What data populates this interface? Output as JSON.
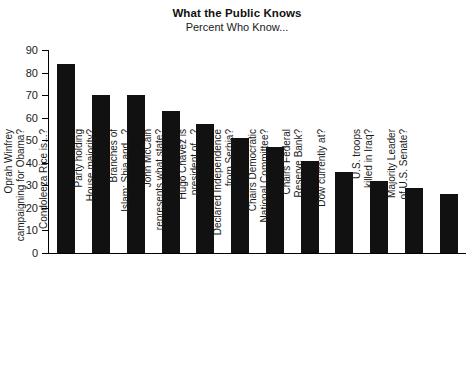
{
  "chart_data": {
    "type": "bar",
    "title": "What the Public Knows",
    "subtitle": "Percent Who Know...",
    "xlabel": "",
    "ylabel": "",
    "ylim": [
      0,
      90
    ],
    "ytick_step": 10,
    "yticks": [
      90,
      80,
      70,
      60,
      50,
      40,
      30,
      20,
      10,
      0
    ],
    "grid": false,
    "legend": "none",
    "bar_color": "#111111",
    "categories": [
      "Oprah Winfrey campaigning for Obama?",
      "Condoleeza Rice is...?",
      "Party holding House majority?",
      "Branches of Islam: Shia and...?",
      "John McCain represents what state?",
      "Hugo Chavez is president of...?",
      "Declared Independence from Serbia?",
      "Chairs Democratic National Committee?",
      "Chairs Federal Reserve Bank?",
      "Dow currently at?",
      "U.S. troops killed in Iraq?",
      "Majority Leader of U.S. Senate?"
    ],
    "category_lines": [
      [
        "Oprah Winfrey",
        "campaigning for Obama?"
      ],
      [
        "Condoleeza Rice is...?",
        ""
      ],
      [
        "Party holding",
        "House majority?"
      ],
      [
        "Branches of",
        "Islam: Shia and...?"
      ],
      [
        "John McCain",
        "represents what state?"
      ],
      [
        "Hugo Chavez is",
        "president of...?"
      ],
      [
        "Declared Independence",
        "from Serbia?"
      ],
      [
        "Chairs Democratic",
        "National Committee?"
      ],
      [
        "Chairs Federal",
        "Reserve Bank?"
      ],
      [
        "Dow currently at?",
        ""
      ],
      [
        "U.S. troops",
        "killed in Iraq?"
      ],
      [
        "Majority Leader",
        "of U.S. Senate?"
      ]
    ],
    "values": [
      84,
      70,
      70,
      63,
      57,
      51,
      47,
      41,
      36,
      32,
      29,
      26
    ]
  }
}
